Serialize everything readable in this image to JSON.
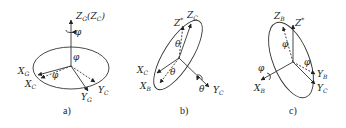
{
  "panels": [
    {
      "id": "a",
      "caption": "a)",
      "labels": {
        "zg": "Z",
        "zg_sub": "G",
        "zc_paren": "(Z",
        "zc_sub": "C",
        "zc_close": ")",
        "phi_top": "φ",
        "phi_center": "φ",
        "phi_lower": "φ",
        "xg": "X",
        "xg_sub": "G",
        "xc": "X",
        "xc_sub": "C",
        "yg": "Y",
        "yg_sub": "G",
        "yc": "Y",
        "yc_sub": "C"
      }
    },
    {
      "id": "b",
      "caption": "b)",
      "labels": {
        "zstar": "Z",
        "zstar_sup": "*",
        "zc": "Z",
        "zc_sub": "C",
        "theta_top": "θ",
        "theta_mid": "θ",
        "theta_right": "θ",
        "xc": "X",
        "xc_sub": "C",
        "xb": "X",
        "xb_sub": "B",
        "yc": "Y",
        "yc_sub": "C"
      }
    },
    {
      "id": "c",
      "caption": "c)",
      "labels": {
        "zb": "Z",
        "zb_sub": "B",
        "zstar": "Z",
        "zstar_sup": "*",
        "phi_top": "φ",
        "phi_left": "φ",
        "phi_right": "φ",
        "xb": "X",
        "xb_sub": "B",
        "yb": "Y",
        "yb_sub": "B",
        "yc": "Y",
        "yc_sub": "C"
      }
    }
  ],
  "colors": {
    "line": "#333333",
    "background": "#ffffff"
  }
}
